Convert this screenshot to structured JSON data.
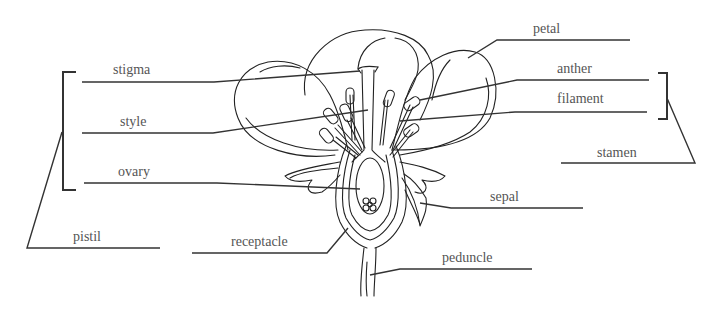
{
  "diagram": {
    "labels": {
      "stigma": "stigma",
      "style": "style",
      "ovary": "ovary",
      "pistil": "pistil",
      "receptacle": "receptacle",
      "petal": "petal",
      "anther": "anther",
      "filament": "filament",
      "stamen": "stamen",
      "sepal": "sepal",
      "peduncle": "peduncle"
    },
    "groups": {
      "pistil_group": [
        "stigma",
        "style",
        "ovary"
      ],
      "stamen_group": [
        "anther",
        "filament"
      ]
    },
    "colors": {
      "line": "#333333",
      "text": "#555555",
      "background": "#ffffff"
    }
  }
}
